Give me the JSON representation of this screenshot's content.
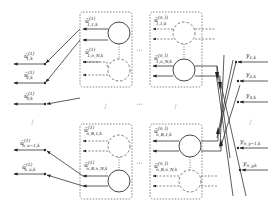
{
  "diagram": {
    "left_outputs": [
      {
        "base": "û",
        "sup": "(1)",
        "sub": "1,k"
      },
      {
        "base": "û",
        "sup": "(1)",
        "sub": "2,k"
      },
      {
        "base": "û",
        "sup": "(1)",
        "sub": "3,k"
      },
      {
        "base": "û",
        "sup": "(1)",
        "sub": "n_u−1,k"
      },
      {
        "base": "û",
        "sup": "(1)",
        "sub": "n_u,k"
      }
    ],
    "blocks": [
      {
        "top": {
          "base": "ũ",
          "sup": "(1)",
          "sub": "1,1,k"
        },
        "bottom": {
          "base": "ũ",
          "sup": "(1)",
          "sub": "1,n_N,k"
        }
      },
      {
        "top": {
          "base": "ũ",
          "sup": "(n_l)",
          "sub": "1,1,k"
        },
        "bottom": {
          "base": "ũ",
          "sup": "(n_l)",
          "sub": "1,n_N,k"
        }
      },
      {
        "top": {
          "base": "ũ",
          "sup": "(1)",
          "sub": "n_B,1,k"
        },
        "bottom": {
          "base": "ũ",
          "sup": "(1)",
          "sub": "n_B,n_N,k"
        }
      },
      {
        "top": {
          "base": "ũ",
          "sup": "(n_l)",
          "sub": "n_B,1,k"
        },
        "bottom": {
          "base": "ũ",
          "sup": "(n_l)",
          "sub": "n_B,n_N,k"
        }
      }
    ],
    "right_inputs": [
      {
        "base": "y",
        "sub": "1,k"
      },
      {
        "base": "y",
        "sub": "2,k"
      },
      {
        "base": "y",
        "sub": "3,k"
      },
      {
        "base": "y",
        "sub": "n_y−1,k"
      },
      {
        "base": "y",
        "sub": "n_y,k"
      }
    ],
    "ellipsis_h": "⋯",
    "ellipsis_v": "⋮"
  }
}
